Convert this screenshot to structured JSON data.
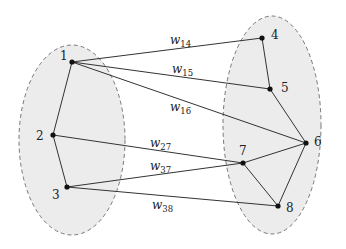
{
  "diagram": {
    "type": "bipartite-graph",
    "groups": [
      {
        "name": "left",
        "nodes": [
          "1",
          "2",
          "3"
        ],
        "fill": "#ececec",
        "stroke": "#777777"
      },
      {
        "name": "right",
        "nodes": [
          "4",
          "5",
          "6",
          "7",
          "8"
        ],
        "fill": "#ececec",
        "stroke": "#777777"
      }
    ],
    "nodes": [
      {
        "id": "1",
        "label": "1",
        "x": 72,
        "y": 62,
        "lx": 60,
        "ly": 60
      },
      {
        "id": "2",
        "label": "2",
        "x": 53,
        "y": 135,
        "lx": 36,
        "ly": 140
      },
      {
        "id": "3",
        "label": "3",
        "x": 67,
        "y": 187,
        "lx": 52,
        "ly": 199
      },
      {
        "id": "4",
        "label": "4",
        "x": 262,
        "y": 38,
        "lx": 271,
        "ly": 39
      },
      {
        "id": "5",
        "label": "5",
        "x": 270,
        "y": 89,
        "lx": 281,
        "ly": 92
      },
      {
        "id": "6",
        "label": "6",
        "x": 306,
        "y": 143,
        "lx": 314,
        "ly": 146
      },
      {
        "id": "7",
        "label": "7",
        "x": 243,
        "y": 163,
        "lx": 239,
        "ly": 155
      },
      {
        "id": "8",
        "label": "8",
        "x": 278,
        "y": 206,
        "lx": 286,
        "ly": 212
      }
    ],
    "edges": [
      {
        "from": "1",
        "to": "2"
      },
      {
        "from": "2",
        "to": "3"
      },
      {
        "from": "4",
        "to": "5"
      },
      {
        "from": "5",
        "to": "6"
      },
      {
        "from": "6",
        "to": "7"
      },
      {
        "from": "6",
        "to": "8"
      },
      {
        "from": "7",
        "to": "8"
      },
      {
        "from": "1",
        "to": "4",
        "weight": "w",
        "sub": "14",
        "wx": 170,
        "wy": 44
      },
      {
        "from": "1",
        "to": "5",
        "weight": "w",
        "sub": "15",
        "wx": 172,
        "wy": 73
      },
      {
        "from": "1",
        "to": "6",
        "weight": "w",
        "sub": "16",
        "wx": 170,
        "wy": 111
      },
      {
        "from": "2",
        "to": "7",
        "weight": "w",
        "sub": "27",
        "wx": 150,
        "wy": 147
      },
      {
        "from": "3",
        "to": "7",
        "weight": "w",
        "sub": "37",
        "wx": 150,
        "wy": 170
      },
      {
        "from": "3",
        "to": "8",
        "weight": "w",
        "sub": "38",
        "wx": 152,
        "wy": 209
      }
    ]
  }
}
